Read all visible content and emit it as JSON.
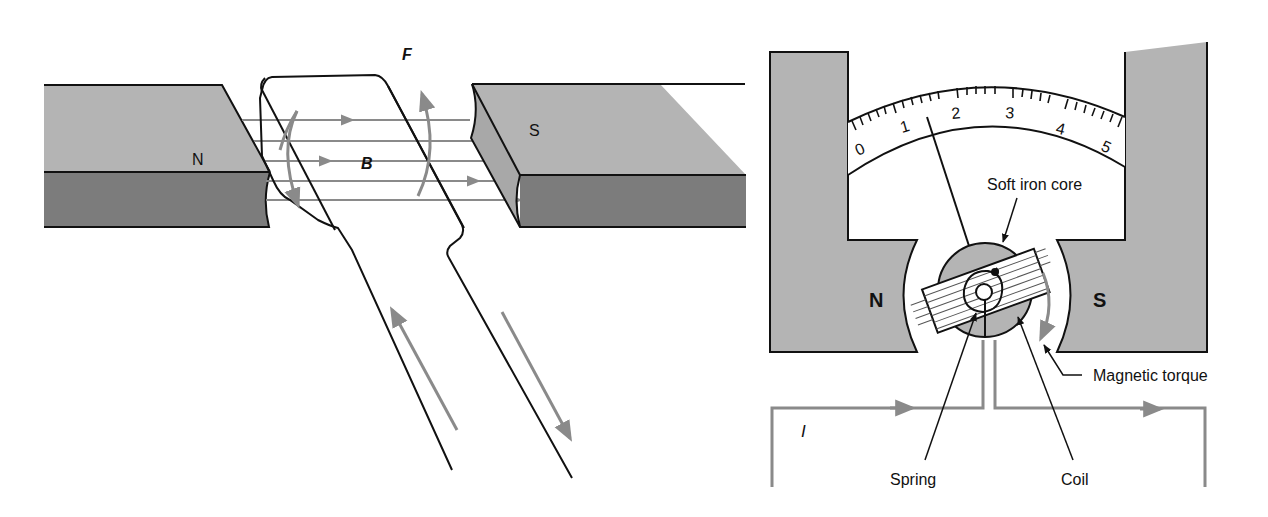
{
  "figure_left": {
    "title": "Force on a current-carrying loop in a magnetic field",
    "north_pole_label": "N",
    "south_pole_label": "S",
    "force_label": "F",
    "field_label": "B"
  },
  "figure_right": {
    "title": "Moving-coil galvanometer",
    "north_pole_label": "N",
    "south_pole_label": "S",
    "scale_labels": [
      "0",
      "1",
      "2",
      "3",
      "4",
      "5"
    ],
    "callouts": {
      "soft_iron_core": "Soft iron core",
      "magnetic_torque": "Magnetic torque",
      "spring": "Spring",
      "coil": "Coil"
    },
    "current_label": "I"
  },
  "colors": {
    "magnet_top": "#b4b4b4",
    "magnet_front": "#7c7c7c",
    "magnet_side": "#a8a8a8",
    "field_line": "#8a8a8a",
    "outline": "#111111",
    "background": "#ffffff"
  }
}
